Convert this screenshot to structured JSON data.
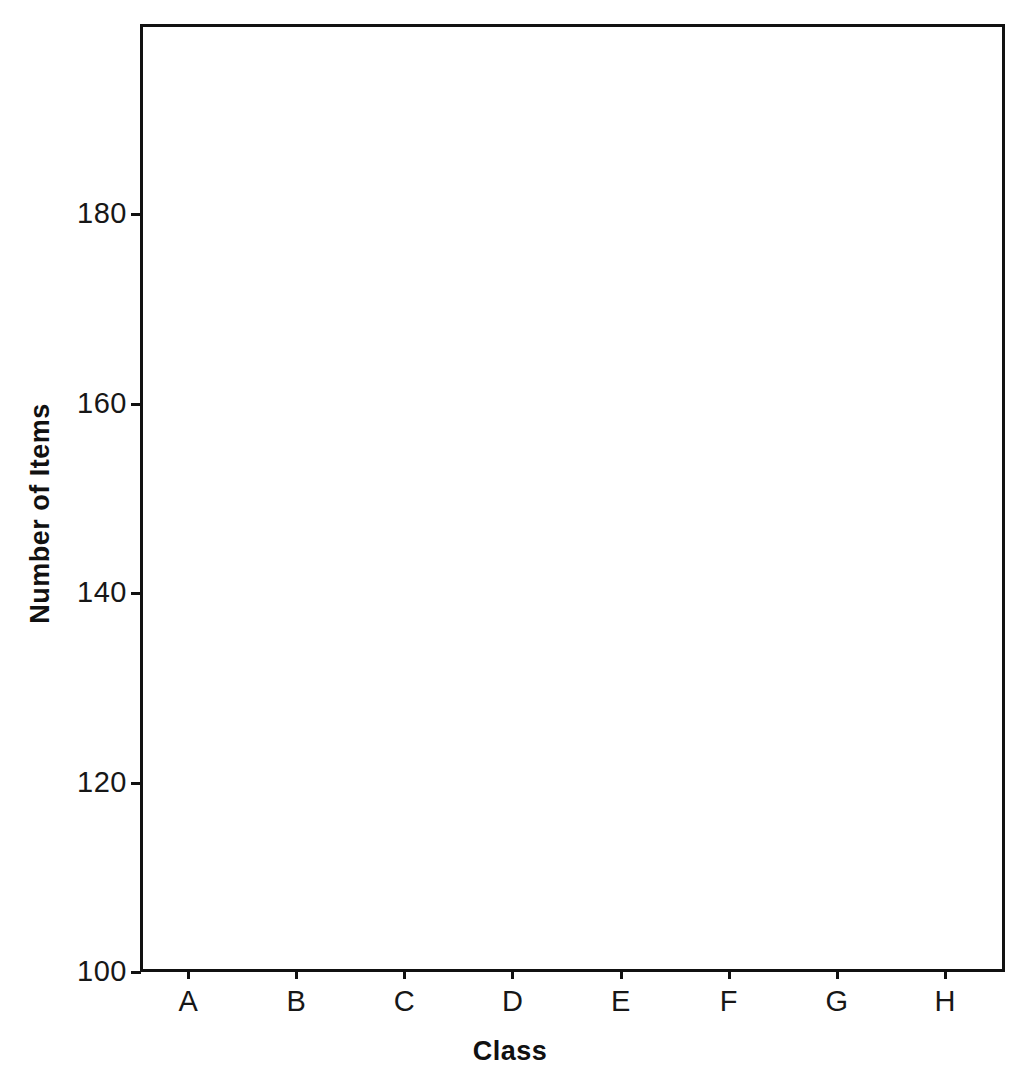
{
  "chart_data": {
    "type": "bar",
    "title": "",
    "subtitle": "",
    "xlabel": "Class",
    "ylabel": "Number of Items",
    "categories": [
      "A",
      "B",
      "C",
      "D",
      "E",
      "F",
      "G",
      "H"
    ],
    "values": [
      120,
      110,
      140,
      150,
      130,
      160,
      180,
      170
    ],
    "series": [
      {
        "name": "Number of Items",
        "values": [
          120,
          110,
          140,
          150,
          130,
          160,
          180,
          170
        ]
      }
    ],
    "ylim": [
      100,
      190
    ],
    "ytick_labels": [
      "100",
      "120",
      "140",
      "160",
      "180"
    ],
    "ytick_values": [
      100,
      120,
      140,
      160,
      180
    ],
    "xtick_labels": [
      "A",
      "B",
      "C",
      "D",
      "E",
      "F",
      "G",
      "H"
    ],
    "grid": true,
    "grid_axis": "y",
    "legend": false,
    "legend_position": "none",
    "bar_color": "#8b8b8b",
    "axis_color": "#111111",
    "gridline_color": "#9a9a9a",
    "background_color": "#ffffff",
    "annotations": []
  },
  "axes": {
    "y_title": "Number of Items",
    "x_title": "Class"
  },
  "ticks": {
    "y": [
      {
        "label": "100",
        "value": 100
      },
      {
        "label": "120",
        "value": 120
      },
      {
        "label": "140",
        "value": 140
      },
      {
        "label": "160",
        "value": 160
      },
      {
        "label": "180",
        "value": 180
      }
    ],
    "x": [
      {
        "label": "A",
        "value": 120
      },
      {
        "label": "B",
        "value": 110
      },
      {
        "label": "C",
        "value": 140
      },
      {
        "label": "D",
        "value": 150
      },
      {
        "label": "E",
        "value": 130
      },
      {
        "label": "F",
        "value": 160
      },
      {
        "label": "G",
        "value": 180
      },
      {
        "label": "H",
        "value": 170
      }
    ]
  }
}
